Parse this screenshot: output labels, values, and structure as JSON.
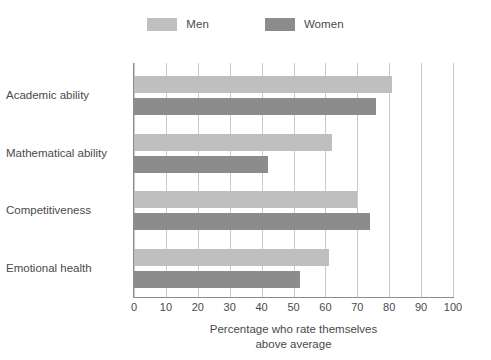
{
  "chart_data": {
    "type": "bar",
    "orientation": "horizontal",
    "title": "",
    "subtitle": "",
    "xlabel_line1": "Percentage who rate themselves",
    "xlabel_line2": "above average",
    "ylabel": "",
    "categories": [
      "Academic ability",
      "Mathematical ability",
      "Competitiveness",
      "Emotional health"
    ],
    "series": [
      {
        "name": "Men",
        "color": "#bfbfbf",
        "values": [
          81,
          62,
          70,
          61
        ]
      },
      {
        "name": "Women",
        "color": "#8c8c8c",
        "values": [
          76,
          42,
          74,
          52
        ]
      }
    ],
    "xlim": [
      0,
      100
    ],
    "xticks": [
      0,
      10,
      20,
      30,
      40,
      50,
      60,
      70,
      80,
      90,
      100
    ],
    "xtick_labels": [
      "0",
      "10",
      "20",
      "30",
      "40",
      "50",
      "60",
      "70",
      "80",
      "90",
      "100"
    ],
    "grid": true,
    "grid_axis": "x",
    "grid_color": "#c9c9c9",
    "legend_position": "top-center",
    "axis_color": "#8c8c8c",
    "text_color": "#4a4a4a",
    "background": "#ffffff"
  },
  "legend": {
    "entries": [
      {
        "label": "Men",
        "color": "#bfbfbf"
      },
      {
        "label": "Women",
        "color": "#8c8c8c"
      }
    ]
  }
}
